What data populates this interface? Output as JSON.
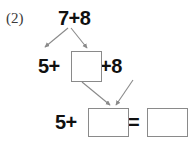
{
  "worksheet": {
    "problem_number": "(2)",
    "top_expression": "7+8",
    "middle_left_expression": "5+",
    "middle_right_expression": "+8",
    "bottom_left_expression": "5+",
    "equals_sign": "=",
    "boxes": [
      {
        "name": "middle-blank",
        "value": ""
      },
      {
        "name": "sum-blank",
        "value": ""
      },
      {
        "name": "result-blank",
        "value": ""
      }
    ],
    "arrows": [
      {
        "name": "decompose-left-arrow"
      },
      {
        "name": "decompose-right-arrow"
      },
      {
        "name": "combine-left-arrow"
      },
      {
        "name": "combine-right-arrow"
      }
    ],
    "colors": {
      "text": "#101010",
      "problem_number": "#3a3a3a",
      "box_border": "#8a8a8a",
      "arrow": "#8a8a8a",
      "background": "#ffffff"
    }
  }
}
